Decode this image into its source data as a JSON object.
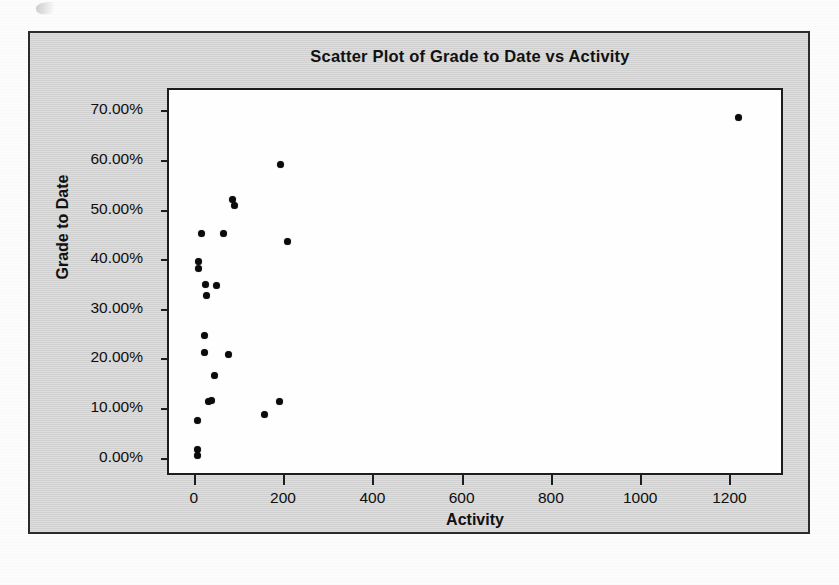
{
  "page": {
    "background_color": "#fcfcfc",
    "frame_color": "#d5d5d5",
    "border_color": "#2b2b2b",
    "marker_color": "#0b0b0b"
  },
  "chart_data": {
    "type": "scatter",
    "title": "Scatter Plot of Grade to Date vs Activity",
    "xlabel": "Activity",
    "ylabel": "Grade to Date",
    "xlim": [
      -60,
      1320
    ],
    "ylim": [
      -0.035,
      0.745
    ],
    "grid": false,
    "legend": null,
    "x_ticks": [
      0,
      200,
      400,
      600,
      800,
      1000,
      1200
    ],
    "x_tick_labels": [
      "0",
      "200",
      "400",
      "600",
      "800",
      "1000",
      "1200"
    ],
    "y_ticks": [
      0.0,
      0.1,
      0.2,
      0.3,
      0.4,
      0.5,
      0.6,
      0.7
    ],
    "y_tick_labels": [
      "0.00%",
      "10.00%",
      "20.00%",
      "30.00%",
      "40.00%",
      "50.00%",
      "60.00%",
      "70.00%"
    ],
    "series": [
      {
        "name": "students",
        "marker": "circle",
        "color": "#0b0b0b",
        "points": [
          {
            "x": 1215,
            "y": 0.69
          },
          {
            "x": 190,
            "y": 0.595
          },
          {
            "x": 83,
            "y": 0.524
          },
          {
            "x": 86,
            "y": 0.512
          },
          {
            "x": 12,
            "y": 0.455
          },
          {
            "x": 62,
            "y": 0.455
          },
          {
            "x": 205,
            "y": 0.44
          },
          {
            "x": 5,
            "y": 0.4
          },
          {
            "x": 6,
            "y": 0.385
          },
          {
            "x": 22,
            "y": 0.352
          },
          {
            "x": 47,
            "y": 0.35
          },
          {
            "x": 24,
            "y": 0.33
          },
          {
            "x": 20,
            "y": 0.25
          },
          {
            "x": 20,
            "y": 0.215
          },
          {
            "x": 74,
            "y": 0.212
          },
          {
            "x": 41,
            "y": 0.17
          },
          {
            "x": 28,
            "y": 0.118
          },
          {
            "x": 35,
            "y": 0.12
          },
          {
            "x": 187,
            "y": 0.118
          },
          {
            "x": 155,
            "y": 0.09
          },
          {
            "x": 3,
            "y": 0.078
          },
          {
            "x": 4,
            "y": 0.02
          },
          {
            "x": 4,
            "y": 0.008
          }
        ]
      }
    ]
  }
}
